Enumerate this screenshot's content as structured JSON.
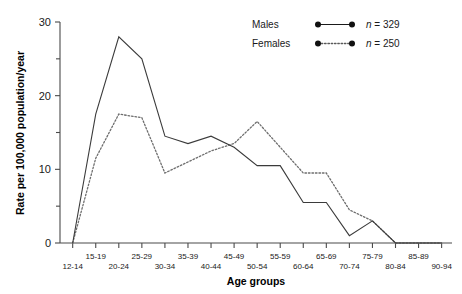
{
  "chart_data": {
    "type": "line",
    "title": "",
    "xlabel": "Age groups",
    "ylabel": "Rate per 100,000 population/year",
    "categories": [
      "12-14",
      "15-19",
      "20-24",
      "25-29",
      "30-34",
      "35-39",
      "40-44",
      "45-49",
      "50-54",
      "55-59",
      "60-64",
      "65-69",
      "70-74",
      "75-79",
      "80-84",
      "85-89",
      "90-94"
    ],
    "series": [
      {
        "name": "Males",
        "n_label": "n = 329",
        "style": "solid",
        "values": [
          0,
          17.5,
          28,
          25,
          14.5,
          13.5,
          14.5,
          13,
          10.5,
          10.5,
          5.5,
          5.5,
          1,
          3,
          0,
          0,
          0
        ]
      },
      {
        "name": "Females",
        "n_label": "n = 250",
        "style": "dotted",
        "values": [
          0,
          11.5,
          17.5,
          17,
          9.5,
          11,
          12.5,
          13.5,
          16.5,
          13,
          9.5,
          9.5,
          4.5,
          3,
          0,
          0,
          0
        ]
      }
    ],
    "ylim": [
      0,
      30
    ],
    "yticks": [
      0,
      10,
      20,
      30
    ],
    "yticks_minor": [
      5,
      15,
      25
    ],
    "ytick_labels": [
      "0",
      "10",
      "20",
      "30"
    ],
    "grid": false,
    "legend_position": "top-right"
  },
  "legend": {
    "rows": [
      {
        "label": "Males",
        "n": "n = 329"
      },
      {
        "label": "Females",
        "n": "n = 250"
      }
    ]
  },
  "axis": {
    "x_title": "Age groups",
    "y_title": "Rate per 100,000 population/year"
  }
}
